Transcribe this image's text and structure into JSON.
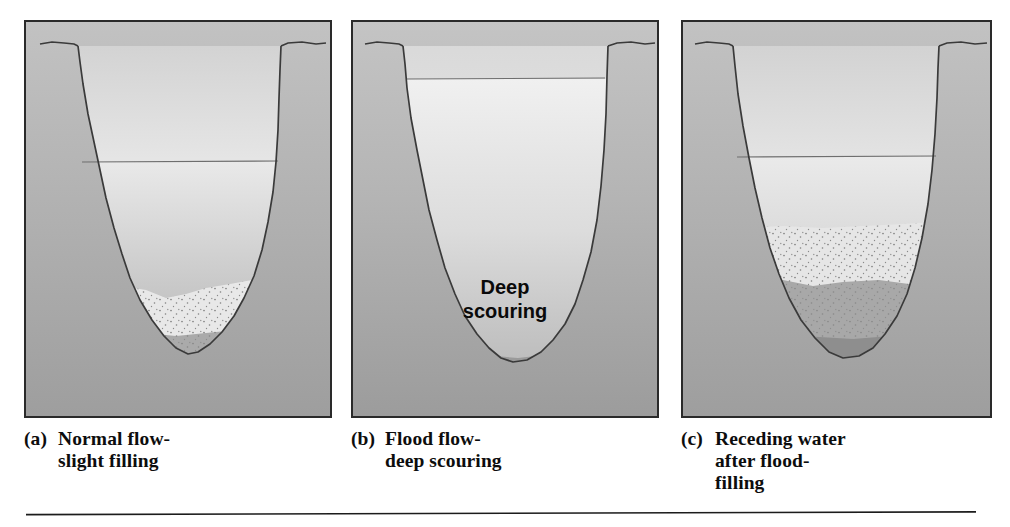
{
  "figure": {
    "panel_count": 3,
    "background_color": "#ffffff",
    "panel_border_color": "#2a2a2a",
    "bank_line_color": "#3a3a3a",
    "water_line_color": "#6e6e6e"
  },
  "panels": [
    {
      "tag": "(a)",
      "caption": "Normal flow-\nslight filling",
      "caption_line1": "Normal flow-",
      "caption_line2": "slight filling",
      "water_surface_label": "",
      "inline_label": "",
      "channel_state": "shallow channel, low water stage, sediment fill in bottom",
      "water_level_px": 160,
      "bank_top_px": 52,
      "channel_bottom_px": 385,
      "fill_layers": [
        {
          "name": "upper-stippled-fill",
          "color": "#e4e4e4",
          "stipple": true
        },
        {
          "name": "middle-stippled-fill",
          "color": "#a8a8a8",
          "stipple": true
        },
        {
          "name": "lower-dark-fill",
          "color": "#909090",
          "stipple": false
        }
      ]
    },
    {
      "tag": "(b)",
      "caption": "Flood flow-\ndeep scouring",
      "caption_line1": "Flood flow-",
      "caption_line2": "deep scouring",
      "water_surface_label": "",
      "inline_label": "Deep\nscouring",
      "inline_label_line1": "Deep",
      "inline_label_line2": "scouring",
      "channel_state": "deeply scoured channel, high flood water stage, minimal fill",
      "water_level_px": 77,
      "bank_top_px": 52,
      "channel_bottom_px": 397,
      "fill_layers": [
        {
          "name": "thin-dark-fill",
          "color": "#989898",
          "stipple": false
        }
      ]
    },
    {
      "tag": "(c)",
      "caption": "Receding water\nafter flood-\nfilling",
      "caption_line1": "Receding water",
      "caption_line2": "after flood-",
      "caption_line3": "filling",
      "water_surface_label": "",
      "inline_label": "",
      "channel_state": "thick multi-layer sediment fill, receding water stage",
      "water_level_px": 155,
      "bank_top_px": 52,
      "channel_bottom_px": 390,
      "fill_layers": [
        {
          "name": "upper-stippled-fill",
          "color": "#e2e2e2",
          "stipple": true
        },
        {
          "name": "middle-stippled-fill",
          "color": "#a6a6a6",
          "stipple": true
        },
        {
          "name": "lower-dark-fill",
          "color": "#8e8e8e",
          "stipple": false
        }
      ]
    }
  ],
  "bottom_rule": {
    "present": true,
    "color": "#1c1c1c"
  }
}
